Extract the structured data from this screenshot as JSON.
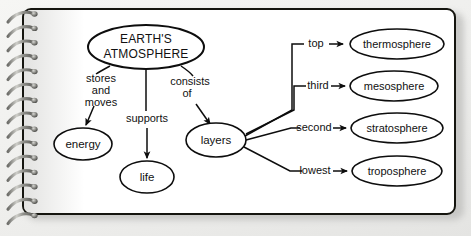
{
  "document": {
    "kind": "spiral-notebook-page",
    "medium": "concept map diagram",
    "page_color": "#ffffff",
    "ink_color": "#0d0d0d",
    "backdrop_color": "#eeeeec"
  },
  "diagram": {
    "title_node": {
      "id": "earths-atmosphere",
      "line1": "EARTH'S",
      "line2": "ATMOSPHERE",
      "cx": 146,
      "cy": 47,
      "rx": 58,
      "ry": 22
    },
    "nodes": [
      {
        "id": "energy",
        "label": "energy",
        "cx": 83,
        "cy": 144,
        "rx": 29,
        "ry": 16
      },
      {
        "id": "life",
        "label": "life",
        "cx": 147,
        "cy": 177,
        "rx": 27,
        "ry": 16
      },
      {
        "id": "layers",
        "label": "layers",
        "cx": 216,
        "cy": 140,
        "rx": 30,
        "ry": 17
      },
      {
        "id": "thermosphere",
        "label": "thermosphere",
        "cx": 397,
        "cy": 44,
        "rx": 47,
        "ry": 15
      },
      {
        "id": "mesosphere",
        "label": "mesosphere",
        "cx": 394,
        "cy": 86,
        "rx": 44,
        "ry": 15
      },
      {
        "id": "stratosphere",
        "label": "stratosphere",
        "cx": 397,
        "cy": 128,
        "rx": 46,
        "ry": 15
      },
      {
        "id": "troposphere",
        "label": "troposphere",
        "cx": 397,
        "cy": 171,
        "rx": 45,
        "ry": 15
      }
    ],
    "edges": [
      {
        "id": "edge-stores-and-moves",
        "from": "earths-atmosphere",
        "to": "energy",
        "label_lines": [
          "stores",
          "and",
          "moves"
        ],
        "label_x": 101,
        "label_y": 88,
        "arrow": true
      },
      {
        "id": "edge-supports",
        "from": "earths-atmosphere",
        "to": "life",
        "label_lines": [
          "supports"
        ],
        "label_x": 147,
        "label_y": 119,
        "arrow": true
      },
      {
        "id": "edge-consists-of",
        "from": "earths-atmosphere",
        "to": "layers",
        "label_lines": [
          "consists",
          "of"
        ],
        "label_x": 188,
        "label_y": 88,
        "arrow": true
      },
      {
        "id": "edge-top",
        "from": "layers",
        "to": "thermosphere",
        "label_lines": [
          "top"
        ],
        "label_x": 316,
        "label_y": 44,
        "arrow": true
      },
      {
        "id": "edge-third",
        "from": "layers",
        "to": "mesosphere",
        "label_lines": [
          "third"
        ],
        "label_x": 318,
        "label_y": 86,
        "arrow": true
      },
      {
        "id": "edge-second",
        "from": "layers",
        "to": "stratosphere",
        "label_lines": [
          "second"
        ],
        "label_x": 313,
        "label_y": 128,
        "arrow": true
      },
      {
        "id": "edge-lowest",
        "from": "layers",
        "to": "troposphere",
        "label_lines": [
          "lowest"
        ],
        "label_x": 315,
        "label_y": 171,
        "arrow": true
      }
    ]
  },
  "binding": {
    "icon": "spiral-wire-binding",
    "coil_count": 15,
    "wire_color": "#9a9a96"
  }
}
